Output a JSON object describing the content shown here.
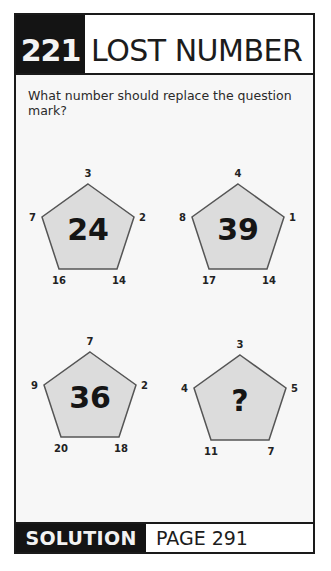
{
  "header": {
    "puzzle_number": "221",
    "title": "LOST NUMBER"
  },
  "question": "What number should replace the question mark?",
  "pentagons": [
    {
      "center": "24",
      "top": "3",
      "right": "2",
      "bottom_right": "14",
      "bottom_left": "16",
      "left": "7"
    },
    {
      "center": "39",
      "top": "4",
      "right": "1",
      "bottom_right": "14",
      "bottom_left": "17",
      "left": "8"
    },
    {
      "center": "36",
      "top": "7",
      "right": "2",
      "bottom_right": "18",
      "bottom_left": "20",
      "left": "9"
    },
    {
      "center": "?",
      "top": "3",
      "right": "5",
      "bottom_right": "7",
      "bottom_left": "11",
      "left": "4"
    }
  ],
  "footer": {
    "solution_label": "SOLUTION",
    "page_label": "PAGE 291"
  },
  "colors": {
    "pentagon_fill": "#dcdcdc",
    "pentagon_stroke": "#555555",
    "header_bg": "#141414",
    "text": "#1c1c1c"
  }
}
